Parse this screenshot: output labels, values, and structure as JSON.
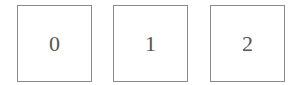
{
  "boxes": [
    {
      "label": "0"
    },
    {
      "label": "1"
    },
    {
      "label": "2"
    }
  ]
}
